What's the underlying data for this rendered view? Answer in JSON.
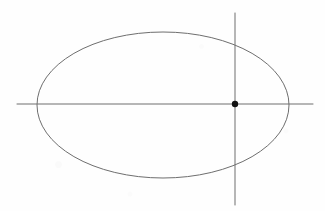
{
  "figure": {
    "background_color": "#fefefe",
    "width": 325,
    "height": 211
  },
  "chart_data": {
    "type": "scatter",
    "title": "",
    "subtitle": "",
    "xlabel": "",
    "ylabel": "",
    "grid": false,
    "legend": null,
    "axis_ticks": [],
    "tick_labels": [],
    "annotations": [],
    "shapes": [
      {
        "name": "ellipse",
        "type": "ellipse",
        "cx": 163,
        "cy": 105,
        "rx": 126,
        "ry": 73,
        "stroke": "#6e6e6e",
        "stroke_width": 1,
        "fill": "none"
      },
      {
        "name": "horizontal-axis-line",
        "type": "line",
        "x1": 17,
        "y1": 104,
        "x2": 313,
        "y2": 104,
        "stroke": "#6e6e6e",
        "stroke_width": 1
      },
      {
        "name": "vertical-axis-line",
        "type": "line",
        "x1": 235,
        "y1": 13,
        "x2": 235,
        "y2": 205,
        "stroke": "#6e6e6e",
        "stroke_width": 1
      }
    ],
    "points": [
      {
        "name": "intersection-point",
        "x": 235,
        "y": 104,
        "radius": 3.2,
        "fill": "#111111",
        "label": ""
      }
    ],
    "colors": {
      "stroke": "#6e6e6e",
      "point": "#111111",
      "background": "#fefefe"
    }
  }
}
